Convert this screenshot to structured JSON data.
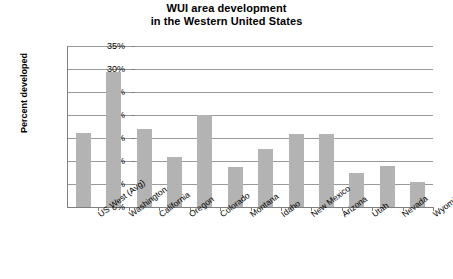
{
  "chart_data": {
    "type": "bar",
    "title": "WUI area development in the Western United States",
    "title_line1": "WUI area development",
    "title_line2": "in the Western United States",
    "xlabel": "",
    "ylabel": "Percent developed",
    "ylim": [
      0,
      35
    ],
    "ytick_labels": [
      "35%",
      "30%",
      "25%",
      "20%",
      "15%",
      "10%",
      "5%",
      "0%"
    ],
    "ytick_values": [
      35,
      30,
      25,
      20,
      15,
      10,
      5,
      0
    ],
    "grid": true,
    "legend": "none",
    "bar_color": "#b3b3b3",
    "categories": [
      "US West (Avg)",
      "Washington",
      "California",
      "Oregon",
      "Colorado",
      "Montana",
      "Idaho",
      "New Mexico",
      "Arizona",
      "Utah",
      "Nevada",
      "Wyoming"
    ],
    "values": [
      16.0,
      29.3,
      17.0,
      10.8,
      20.0,
      8.8,
      12.7,
      15.8,
      15.8,
      7.4,
      8.9,
      5.5
    ]
  }
}
